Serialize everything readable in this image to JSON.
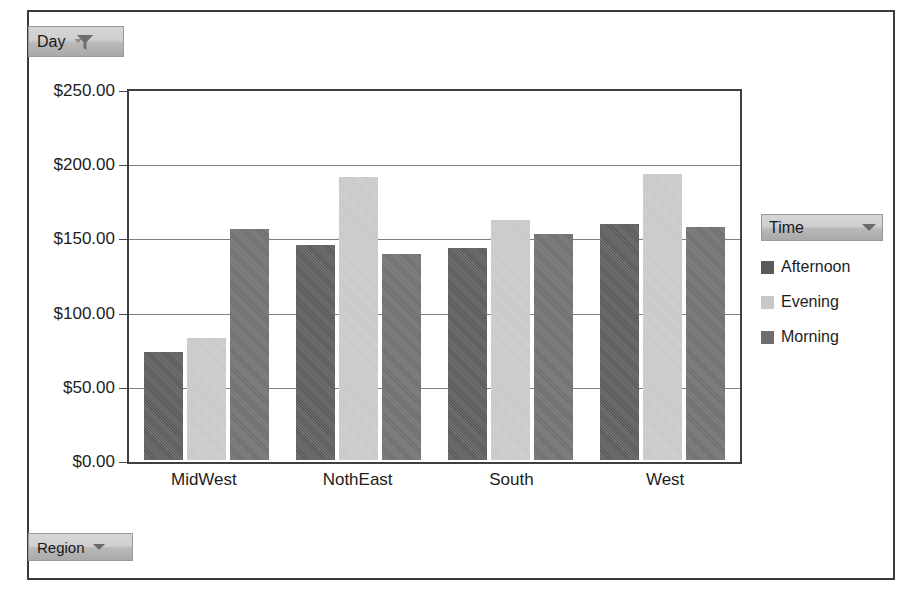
{
  "pivot_filters": {
    "day_button": {
      "label": "Day",
      "icon": "filter-funnel-icon",
      "caret": "chevron-down-icon"
    },
    "region_button": {
      "label": "Region",
      "caret": "chevron-down-icon"
    }
  },
  "legend": {
    "title": "Time",
    "caret": "chevron-down-icon",
    "items": [
      {
        "label": "Afternoon",
        "color": "#5a5a5a"
      },
      {
        "label": "Evening",
        "color": "#c8c8c8"
      },
      {
        "label": "Morning",
        "color": "#6e6e6e"
      }
    ]
  },
  "axis": {
    "y_ticks": [
      "$250.00",
      "$200.00",
      "$150.00",
      "$100.00",
      "$50.00",
      "$0.00"
    ]
  },
  "chart_data": {
    "type": "bar",
    "title": "",
    "xlabel": "",
    "ylabel": "",
    "categories": [
      "MidWest",
      "NothEast",
      "South",
      "West"
    ],
    "series": [
      {
        "name": "Afternoon",
        "color": "#5a5a5a",
        "values": [
          73,
          145,
          143,
          159
        ]
      },
      {
        "name": "Evening",
        "color": "#c8c8c8",
        "values": [
          82,
          191,
          162,
          193
        ]
      },
      {
        "name": "Morning",
        "color": "#6e6e6e",
        "values": [
          156,
          139,
          152,
          157
        ]
      }
    ],
    "ylim": [
      0,
      250
    ],
    "ytick_values": [
      0,
      50,
      100,
      150,
      200,
      250
    ],
    "ytick_labels": [
      "$0.00",
      "$50.00",
      "$100.00",
      "$150.00",
      "$200.00",
      "$250.00"
    ],
    "grid": true,
    "legend_position": "right",
    "value_prefix": "$"
  }
}
